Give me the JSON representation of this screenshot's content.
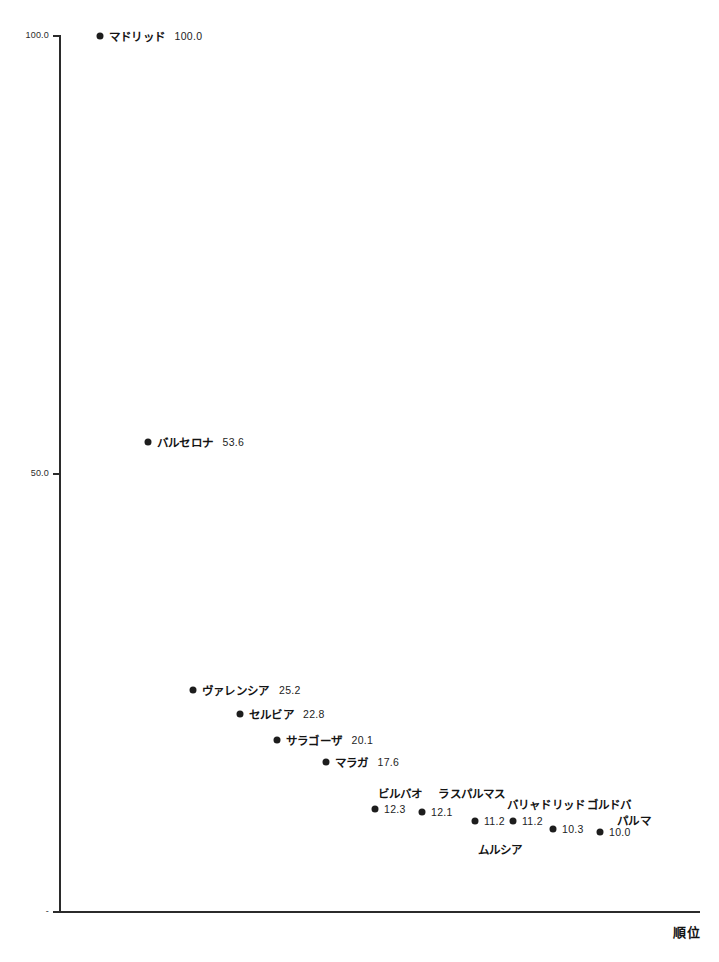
{
  "chart_data": {
    "type": "scatter",
    "title": "",
    "xlabel": "順位",
    "ylabel": "",
    "ylim": [
      0,
      100
    ],
    "grid": false,
    "legend": false,
    "y_ticks": [
      {
        "label": "100.0",
        "value": 100.0
      },
      {
        "label": "50.0",
        "value": 50.0
      },
      {
        "label": "-",
        "value": 0.0
      }
    ],
    "x_ticks": [],
    "points": [
      {
        "rank": 1,
        "name": "マドリッド",
        "value": "100.0",
        "y": 100.0,
        "px": 100,
        "py": 36,
        "name_pos": "inline"
      },
      {
        "rank": 2,
        "name": "バルセロナ",
        "value": "53.6",
        "y": 53.6,
        "px": 148,
        "py": 442,
        "name_pos": "inline"
      },
      {
        "rank": 3,
        "name": "ヴァレンシア",
        "value": "25.2",
        "y": 25.2,
        "px": 193,
        "py": 690,
        "name_pos": "inline"
      },
      {
        "rank": 4,
        "name": "セルビア",
        "value": "22.8",
        "y": 22.8,
        "px": 240,
        "py": 714,
        "name_pos": "inline"
      },
      {
        "rank": 5,
        "name": "サラゴーザ",
        "value": "20.1",
        "y": 20.1,
        "px": 277,
        "py": 740,
        "name_pos": "inline"
      },
      {
        "rank": 6,
        "name": "マラガ",
        "value": "17.6",
        "y": 17.6,
        "px": 326,
        "py": 762,
        "name_pos": "inline"
      },
      {
        "rank": 7,
        "name": "ビルバオ",
        "value": "12.3",
        "y": 12.3,
        "px": 375,
        "py": 809,
        "name_pos": "above",
        "name_x": 400,
        "name_y": 801
      },
      {
        "rank": 8,
        "name": "ラスパルマス",
        "value": "12.1",
        "y": 12.1,
        "px": 422,
        "py": 812,
        "name_pos": "above",
        "name_x": 472,
        "name_y": 801
      },
      {
        "rank": 9,
        "name": "ムルシア",
        "value": "11.2",
        "y": 11.2,
        "px": 475,
        "py": 821,
        "name_pos": "below",
        "name_x": 500,
        "name_y": 841
      },
      {
        "rank": 10,
        "name": "バリャドリッド",
        "value": "11.2",
        "y": 11.2,
        "px": 513,
        "py": 821,
        "name_pos": "above",
        "name_x": 546,
        "name_y": 812
      },
      {
        "rank": 11,
        "name": "ゴルドバ",
        "value": "10.3",
        "y": 10.3,
        "px": 553,
        "py": 829,
        "name_pos": "above",
        "name_x": 609,
        "name_y": 812
      },
      {
        "rank": 12,
        "name": "パルマ",
        "value": "10.0",
        "y": 10.0,
        "px": 600,
        "py": 832,
        "name_pos": "above",
        "name_x": 634,
        "name_y": 828
      }
    ]
  },
  "axis": {
    "x_title": "順位"
  },
  "colors": {
    "point": "#1d1d1d",
    "axis": "#2b2b2b",
    "background": "#ffffff"
  }
}
